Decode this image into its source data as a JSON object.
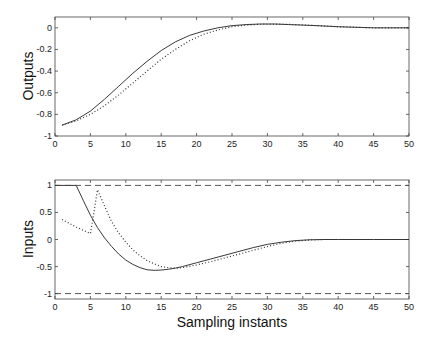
{
  "chart_data": [
    {
      "type": "line",
      "title": "",
      "xlabel": "",
      "ylabel": "Outputs",
      "xlim": [
        0,
        50
      ],
      "ylim": [
        -1,
        0.1
      ],
      "xticks": [
        0,
        5,
        10,
        15,
        20,
        25,
        30,
        35,
        40,
        45,
        50
      ],
      "yticks": [
        -1,
        -0.8,
        -0.6,
        -0.4,
        -0.2,
        0
      ],
      "ytick_labels": [
        "-1",
        "-0.8",
        "-0.6",
        "-0.4",
        "-0.2",
        "0"
      ],
      "grid": false,
      "series": [
        {
          "name": "output (solid)",
          "style": "solid",
          "x": [
            1,
            3,
            5,
            7,
            9,
            11,
            13,
            15,
            17,
            19,
            21,
            23,
            25,
            27,
            29,
            31,
            33,
            35,
            37,
            40,
            45,
            50
          ],
          "y": [
            -0.9,
            -0.85,
            -0.77,
            -0.66,
            -0.54,
            -0.42,
            -0.31,
            -0.21,
            -0.13,
            -0.07,
            -0.03,
            0.0,
            0.02,
            0.03,
            0.035,
            0.035,
            0.03,
            0.025,
            0.02,
            0.01,
            0.0,
            0.0
          ]
        },
        {
          "name": "output (dotted)",
          "style": "dotted",
          "x": [
            1,
            3,
            5,
            7,
            9,
            11,
            13,
            15,
            17,
            19,
            21,
            23,
            25,
            27,
            29,
            31,
            33,
            35,
            37,
            40,
            45,
            50
          ],
          "y": [
            -0.9,
            -0.86,
            -0.8,
            -0.72,
            -0.62,
            -0.51,
            -0.4,
            -0.29,
            -0.2,
            -0.12,
            -0.06,
            -0.02,
            0.01,
            0.025,
            0.033,
            0.035,
            0.032,
            0.027,
            0.02,
            0.01,
            0.0,
            0.0
          ]
        }
      ]
    },
    {
      "type": "line",
      "title": "",
      "xlabel": "Sampling instants",
      "ylabel": "Inputs",
      "xlim": [
        0,
        50
      ],
      "ylim": [
        -1.1,
        1.1
      ],
      "xticks": [
        0,
        5,
        10,
        15,
        20,
        25,
        30,
        35,
        40,
        45,
        50
      ],
      "yticks": [
        -1,
        -0.5,
        0,
        0.5,
        1
      ],
      "ytick_labels": [
        "-1",
        "-0.5",
        "0",
        "0.5",
        "1"
      ],
      "grid": false,
      "series": [
        {
          "name": "input (solid)",
          "style": "solid",
          "x": [
            0,
            3,
            4,
            5,
            6,
            7,
            8,
            9,
            10,
            11,
            12,
            13,
            14,
            15,
            16,
            17,
            18,
            20,
            22,
            24,
            26,
            28,
            30,
            32,
            34,
            36,
            38,
            40,
            45,
            50
          ],
          "y": [
            1,
            1,
            0.72,
            0.45,
            0.22,
            0.03,
            -0.13,
            -0.27,
            -0.38,
            -0.46,
            -0.52,
            -0.56,
            -0.57,
            -0.565,
            -0.55,
            -0.53,
            -0.5,
            -0.43,
            -0.36,
            -0.29,
            -0.22,
            -0.15,
            -0.09,
            -0.05,
            -0.02,
            -0.005,
            0.0,
            0.0,
            0.0,
            0.0
          ]
        },
        {
          "name": "input (dotted)",
          "style": "dotted",
          "x": [
            1,
            2,
            3,
            4,
            5,
            5.5,
            6,
            7,
            8,
            9,
            10,
            11,
            12,
            13,
            14,
            15,
            16,
            17,
            18,
            20,
            22,
            24,
            26,
            28,
            30,
            32,
            34,
            36,
            38,
            40,
            45,
            50
          ],
          "y": [
            0.37,
            0.3,
            0.23,
            0.17,
            0.11,
            0.5,
            0.92,
            0.62,
            0.33,
            0.12,
            -0.05,
            -0.19,
            -0.3,
            -0.39,
            -0.45,
            -0.5,
            -0.52,
            -0.53,
            -0.52,
            -0.47,
            -0.41,
            -0.34,
            -0.27,
            -0.2,
            -0.13,
            -0.07,
            -0.03,
            -0.01,
            0.0,
            0.0,
            0.0,
            0.0
          ]
        },
        {
          "name": "upper bound",
          "style": "dashed",
          "x": [
            0,
            50
          ],
          "y": [
            1,
            1
          ]
        },
        {
          "name": "lower bound",
          "style": "dashed",
          "x": [
            0,
            50
          ],
          "y": [
            -1,
            -1
          ]
        }
      ]
    }
  ]
}
